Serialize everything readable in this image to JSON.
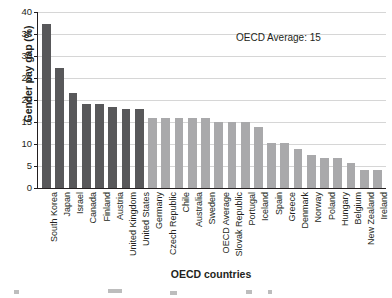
{
  "chart_data": {
    "type": "bar",
    "title": "",
    "xlabel": "OECD countries",
    "ylabel": "Gender pay gap (%)",
    "ylim": [
      0,
      40
    ],
    "yticks": [
      0,
      5,
      10,
      15,
      20,
      25,
      30,
      35,
      40
    ],
    "grid": true,
    "legend": "none",
    "annotations": [
      {
        "text": "OECD Average: 15"
      }
    ],
    "categories": [
      "South Korea",
      "Japan",
      "Israel",
      "Canada",
      "Finland",
      "Austria",
      "United Kingdom",
      "United States",
      "Germany",
      "Czech Republic",
      "Chile",
      "Australia",
      "Sweden",
      "OECD Average",
      "Slovak Republic",
      "Portugal",
      "Iceland",
      "Spain",
      "Greece",
      "Denmark",
      "Norway",
      "Poland",
      "Hungary",
      "Belgium",
      "New Zealand",
      "Ireland"
    ],
    "values": [
      37.2,
      27.2,
      21.6,
      19.0,
      19.0,
      18.4,
      17.9,
      17.9,
      16.0,
      16.0,
      16.0,
      16.0,
      16.0,
      15.0,
      15.0,
      15.0,
      13.9,
      10.3,
      10.2,
      8.8,
      7.6,
      6.9,
      6.9,
      5.7,
      4.0,
      4.0
    ],
    "bar_colors": [
      "dark",
      "dark",
      "dark",
      "dark",
      "dark",
      "dark",
      "dark",
      "dark",
      "light",
      "light",
      "light",
      "light",
      "light",
      "light",
      "light",
      "light",
      "light",
      "light",
      "light",
      "light",
      "light",
      "light",
      "light",
      "light",
      "light",
      "light"
    ],
    "colors": {
      "dark": "#58585a",
      "light": "#a9a9ab",
      "grid": "#d6d6d6",
      "axis": "#231f20",
      "background": "#ffffff"
    }
  }
}
